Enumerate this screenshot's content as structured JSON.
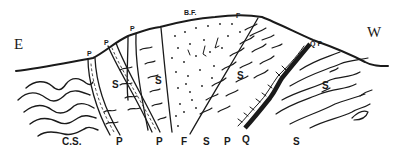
{
  "diagram": {
    "type": "geological-cross-section",
    "ink_color": "#1a1a1a",
    "background": "#ffffff",
    "orientation": {
      "left": "E",
      "right": "W"
    },
    "labels": {
      "east": "E",
      "west": "W",
      "bf": "B.F.",
      "f_top": "F",
      "qp_top": "Q P",
      "p_top_1": "P",
      "p_top_2": "P",
      "p_top_3": "P",
      "s_1": "S",
      "s_2": "S",
      "s_3": "S",
      "s_4": "S",
      "cs": "C.S.",
      "p_bottom_1": "P",
      "p_bottom_2": "P",
      "f_bottom": "F",
      "s_bottom_1": "S",
      "p_bottom_3": "P",
      "q_bottom": "Q",
      "s_bottom_2": "S"
    }
  }
}
